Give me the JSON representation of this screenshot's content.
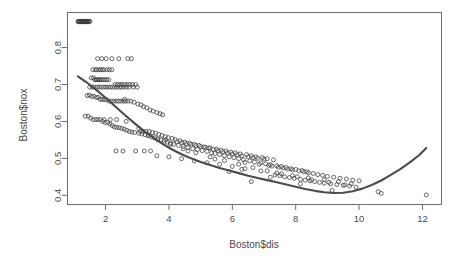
{
  "chart_data": {
    "type": "scatter",
    "title": "",
    "xlabel": "Boston$dis",
    "ylabel": "Boston$nox",
    "xlim": [
      0.8,
      12.6
    ],
    "ylim": [
      0.375,
      0.895
    ],
    "xticks": [
      2,
      4,
      6,
      8,
      10,
      12
    ],
    "yticks": [
      0.4,
      0.5,
      0.6,
      0.7,
      0.8
    ],
    "xtick_labels": [
      "2",
      "4",
      "6",
      "8",
      "10",
      "12"
    ],
    "ytick_labels": [
      "0.4",
      "0.5",
      "0.6",
      "0.7",
      "0.8"
    ],
    "grid": false,
    "legend": "none",
    "point_marker": "open-circle",
    "point_color": "#3b3b3b",
    "smooth_color": "#4c4c4c",
    "box_color": "#6e6e6e",
    "series": [
      {
        "name": "Boston nox vs dis",
        "x": [
          1.13,
          1.17,
          1.2,
          1.23,
          1.26,
          1.3,
          1.33,
          1.37,
          1.4,
          1.44,
          1.48,
          1.51,
          1.14,
          1.18,
          1.22,
          1.27,
          1.31,
          1.35,
          1.39,
          1.43,
          1.46,
          1.75,
          1.88,
          2.02,
          2.2,
          2.42,
          2.7,
          2.82,
          1.6,
          1.68,
          1.72,
          1.79,
          1.85,
          1.9,
          1.95,
          2.05,
          2.12,
          2.2,
          1.55,
          1.62,
          1.66,
          1.7,
          1.74,
          1.78,
          1.82,
          1.86,
          1.92,
          1.98,
          2.04,
          2.1,
          2.3,
          2.38,
          2.45,
          2.52,
          2.6,
          2.68,
          2.76,
          2.85,
          2.95,
          1.5,
          1.58,
          1.64,
          1.73,
          1.8,
          1.87,
          1.94,
          2.01,
          2.08,
          2.15,
          2.22,
          2.29,
          2.36,
          2.44,
          2.5,
          2.58,
          2.66,
          2.74,
          2.88,
          3.0,
          1.42,
          1.49,
          1.56,
          1.63,
          1.71,
          1.77,
          1.83,
          1.89,
          1.96,
          2.03,
          2.11,
          2.18,
          2.26,
          2.34,
          2.41,
          2.48,
          2.56,
          2.63,
          2.71,
          2.8,
          2.9,
          3.02,
          3.12,
          3.2,
          3.3,
          3.4,
          3.5,
          3.62,
          3.72,
          3.8,
          1.36,
          1.45,
          1.53,
          1.61,
          1.69,
          1.76,
          1.84,
          1.91,
          1.99,
          2.07,
          2.14,
          2.21,
          2.28,
          2.35,
          2.43,
          2.51,
          2.59,
          2.67,
          2.75,
          2.83,
          2.92,
          3.05,
          3.15,
          3.25,
          3.35,
          3.45,
          3.55,
          3.65,
          3.75,
          3.85,
          3.95,
          4.05,
          4.15,
          4.3,
          4.45,
          4.6,
          4.75,
          4.9,
          5.05,
          5.2,
          3.1,
          3.18,
          3.28,
          3.38,
          3.48,
          3.58,
          3.68,
          3.78,
          3.88,
          3.98,
          4.1,
          4.2,
          4.35,
          4.5,
          4.65,
          4.8,
          4.95,
          5.1,
          5.25,
          5.4,
          5.55,
          5.7,
          5.85,
          6.0,
          6.15,
          6.3,
          6.5,
          6.65,
          6.8,
          7.0,
          4.25,
          4.4,
          4.55,
          4.7,
          4.85,
          5.0,
          5.15,
          5.3,
          5.5,
          5.65,
          5.8,
          5.95,
          6.1,
          6.25,
          6.45,
          6.6,
          6.75,
          6.95,
          7.1,
          7.3,
          5.35,
          5.45,
          5.6,
          5.75,
          5.9,
          6.05,
          6.2,
          6.35,
          6.55,
          6.7,
          6.9,
          7.05,
          7.2,
          7.4,
          7.55,
          7.7,
          7.85,
          8.0,
          8.2,
          8.35,
          6.4,
          6.85,
          7.15,
          7.25,
          7.45,
          7.6,
          7.75,
          7.9,
          8.1,
          8.25,
          8.4,
          8.55,
          8.7,
          8.85,
          9.0,
          9.2,
          9.4,
          9.6,
          9.8,
          10.0,
          7.35,
          7.5,
          7.65,
          7.8,
          7.95,
          8.15,
          8.3,
          8.45,
          8.6,
          8.75,
          8.9,
          9.1,
          9.3,
          9.5,
          9.7,
          9.9,
          10.6,
          10.7,
          12.12,
          2.33,
          2.55,
          2.95,
          3.22,
          3.42,
          3.62,
          4.0,
          4.4,
          4.8,
          5.2,
          5.6,
          6.0,
          6.4,
          6.9,
          7.4,
          7.9,
          8.4,
          8.9,
          9.35,
          9.75,
          1.95,
          2.15,
          2.35,
          2.65,
          3.05,
          3.35,
          3.65,
          4.05,
          4.45,
          4.85,
          5.3,
          5.75,
          6.2,
          6.65,
          7.1,
          7.55,
          8.05,
          8.5,
          9.05,
          9.55,
          2.6,
          3.9,
          4.6,
          5.45,
          6.3,
          7.2,
          8.15,
          9.15,
          6.6,
          5.9
        ],
        "y": [
          0.871,
          0.871,
          0.871,
          0.871,
          0.871,
          0.871,
          0.871,
          0.871,
          0.871,
          0.871,
          0.871,
          0.871,
          0.87,
          0.87,
          0.87,
          0.87,
          0.87,
          0.87,
          0.87,
          0.87,
          0.87,
          0.77,
          0.77,
          0.77,
          0.77,
          0.77,
          0.77,
          0.77,
          0.74,
          0.74,
          0.74,
          0.74,
          0.74,
          0.74,
          0.74,
          0.74,
          0.74,
          0.74,
          0.718,
          0.718,
          0.713,
          0.713,
          0.713,
          0.713,
          0.713,
          0.713,
          0.713,
          0.713,
          0.713,
          0.713,
          0.7,
          0.7,
          0.7,
          0.7,
          0.7,
          0.7,
          0.7,
          0.7,
          0.7,
          0.693,
          0.693,
          0.693,
          0.693,
          0.693,
          0.693,
          0.693,
          0.693,
          0.693,
          0.693,
          0.693,
          0.693,
          0.693,
          0.693,
          0.693,
          0.693,
          0.693,
          0.693,
          0.693,
          0.693,
          0.67,
          0.671,
          0.668,
          0.668,
          0.665,
          0.665,
          0.66,
          0.66,
          0.659,
          0.659,
          0.655,
          0.655,
          0.655,
          0.655,
          0.655,
          0.655,
          0.655,
          0.655,
          0.655,
          0.655,
          0.652,
          0.647,
          0.645,
          0.64,
          0.637,
          0.631,
          0.628,
          0.624,
          0.621,
          0.618,
          0.614,
          0.614,
          0.609,
          0.605,
          0.605,
          0.605,
          0.605,
          0.6,
          0.597,
          0.597,
          0.593,
          0.589,
          0.585,
          0.584,
          0.583,
          0.581,
          0.579,
          0.576,
          0.573,
          0.571,
          0.57,
          0.568,
          0.566,
          0.564,
          0.561,
          0.558,
          0.555,
          0.553,
          0.55,
          0.547,
          0.544,
          0.541,
          0.538,
          0.535,
          0.532,
          0.529,
          0.526,
          0.524,
          0.521,
          0.519,
          0.573,
          0.573,
          0.573,
          0.573,
          0.57,
          0.568,
          0.565,
          0.562,
          0.559,
          0.556,
          0.554,
          0.551,
          0.548,
          0.544,
          0.541,
          0.538,
          0.535,
          0.531,
          0.528,
          0.524,
          0.521,
          0.518,
          0.515,
          0.512,
          0.51,
          0.507,
          0.504,
          0.502,
          0.5,
          0.498,
          0.545,
          0.543,
          0.54,
          0.538,
          0.535,
          0.532,
          0.53,
          0.528,
          0.525,
          0.522,
          0.52,
          0.517,
          0.515,
          0.512,
          0.51,
          0.507,
          0.504,
          0.502,
          0.499,
          0.496,
          0.515,
          0.513,
          0.51,
          0.507,
          0.504,
          0.502,
          0.499,
          0.496,
          0.493,
          0.49,
          0.488,
          0.485,
          0.483,
          0.48,
          0.478,
          0.475,
          0.472,
          0.47,
          0.467,
          0.464,
          0.489,
          0.484,
          0.481,
          0.479,
          0.476,
          0.474,
          0.471,
          0.469,
          0.466,
          0.464,
          0.461,
          0.459,
          0.456,
          0.454,
          0.451,
          0.449,
          0.446,
          0.444,
          0.441,
          0.439,
          0.455,
          0.453,
          0.45,
          0.448,
          0.446,
          0.443,
          0.441,
          0.439,
          0.437,
          0.435,
          0.433,
          0.431,
          0.429,
          0.427,
          0.425,
          0.422,
          0.41,
          0.405,
          0.401,
          0.52,
          0.52,
          0.52,
          0.52,
          0.52,
          0.507,
          0.504,
          0.499,
          0.493,
          0.488,
          0.484,
          0.478,
          0.472,
          0.466,
          0.46,
          0.453,
          0.447,
          0.442,
          0.437,
          0.431,
          0.605,
          0.605,
          0.605,
          0.6,
          0.581,
          0.563,
          0.55,
          0.538,
          0.526,
          0.515,
          0.504,
          0.494,
          0.484,
          0.475,
          0.466,
          0.458,
          0.45,
          0.442,
          0.435,
          0.428,
          0.66,
          0.55,
          0.52,
          0.498,
          0.47,
          0.449,
          0.431,
          0.413,
          0.437,
          0.464
        ]
      }
    ],
    "smooth_curve": {
      "name": "loess-smooth",
      "x": [
        1.13,
        1.4,
        1.7,
        2.0,
        2.3,
        2.6,
        2.9,
        3.2,
        3.5,
        3.8,
        4.1,
        4.4,
        4.7,
        5.0,
        5.3,
        5.6,
        5.9,
        6.2,
        6.5,
        6.8,
        7.1,
        7.4,
        7.7,
        8.0,
        8.3,
        8.6,
        8.9,
        9.2,
        9.5,
        9.8,
        10.1,
        10.4,
        10.7,
        11.0,
        11.3,
        11.6,
        11.9,
        12.12
      ],
      "y": [
        0.722,
        0.706,
        0.686,
        0.664,
        0.641,
        0.618,
        0.596,
        0.575,
        0.556,
        0.539,
        0.524,
        0.511,
        0.5,
        0.49,
        0.482,
        0.474,
        0.467,
        0.46,
        0.453,
        0.447,
        0.441,
        0.435,
        0.429,
        0.423,
        0.417,
        0.412,
        0.408,
        0.406,
        0.407,
        0.411,
        0.418,
        0.428,
        0.44,
        0.455,
        0.471,
        0.489,
        0.509,
        0.528
      ]
    }
  }
}
